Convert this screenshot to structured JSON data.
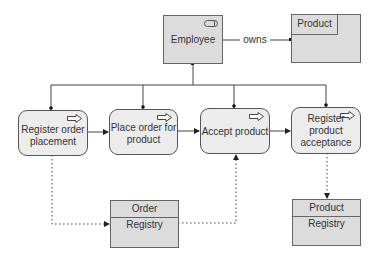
{
  "diagram": {
    "actor": {
      "label": "Employee",
      "icon": "toggle-icon"
    },
    "relation": {
      "label": "owns"
    },
    "owned_entity": {
      "label": "Product"
    },
    "processes": [
      {
        "label_lines": [
          "Register order",
          "placement"
        ],
        "icon": "arrow-right-outline-icon"
      },
      {
        "label_lines": [
          "Place order for",
          "product"
        ],
        "icon": "arrow-right-outline-icon"
      },
      {
        "label_lines": [
          "Accept product"
        ],
        "icon": "arrow-right-outline-icon"
      },
      {
        "label_lines": [
          "Register",
          "product",
          "acceptance"
        ],
        "icon": "arrow-right-outline-icon"
      }
    ],
    "registries": [
      {
        "title": "Order",
        "subtitle": "Registry"
      },
      {
        "title": "Product",
        "subtitle": "Registry"
      }
    ],
    "colors": {
      "box_fill": "#dcdcdc",
      "process_fill": "#ececec",
      "line": "#333333"
    }
  }
}
